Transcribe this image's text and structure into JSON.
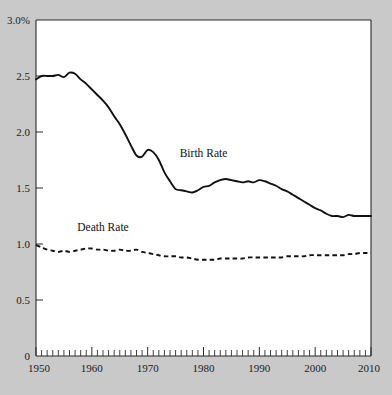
{
  "chart_data": {
    "type": "line",
    "title": "",
    "subtitle": "",
    "xlabel": "",
    "ylabel": "",
    "xlim": [
      1950,
      2010
    ],
    "ylim": [
      0,
      3.0
    ],
    "grid": false,
    "legend_position": "inline-annotations",
    "y_ticks": [
      {
        "value": 3.0,
        "label": "3.0%"
      },
      {
        "value": 2.5,
        "label": "2.5"
      },
      {
        "value": 2.0,
        "label": "2.0"
      },
      {
        "value": 1.5,
        "label": "1.5"
      },
      {
        "value": 1.0,
        "label": "1.0"
      },
      {
        "value": 0.5,
        "label": "0.5"
      },
      {
        "value": 0.0,
        "label": "0"
      }
    ],
    "x_ticks": [
      {
        "value": 1950,
        "label": "1950"
      },
      {
        "value": 1960,
        "label": "1960"
      },
      {
        "value": 1970,
        "label": "1970"
      },
      {
        "value": 1980,
        "label": "1980"
      },
      {
        "value": 1990,
        "label": "1990"
      },
      {
        "value": 2000,
        "label": "2000"
      },
      {
        "value": 2010,
        "label": "2010"
      }
    ],
    "x_minor_tick_interval": 1,
    "annotations": [
      {
        "text": "Birth Rate",
        "x": 1980,
        "y": 1.78
      },
      {
        "text": "Death Rate",
        "x": 1962,
        "y": 1.12
      }
    ],
    "x": [
      1950,
      1951,
      1952,
      1953,
      1954,
      1955,
      1956,
      1957,
      1958,
      1959,
      1960,
      1961,
      1962,
      1963,
      1964,
      1965,
      1966,
      1967,
      1968,
      1969,
      1970,
      1971,
      1972,
      1973,
      1974,
      1975,
      1976,
      1977,
      1978,
      1979,
      1980,
      1981,
      1982,
      1983,
      1984,
      1985,
      1986,
      1987,
      1988,
      1989,
      1990,
      1991,
      1992,
      1993,
      1994,
      1995,
      1996,
      1997,
      1998,
      1999,
      2000,
      2001,
      2002,
      2003,
      2004,
      2005,
      2006,
      2007,
      2008,
      2009,
      2010
    ],
    "series": [
      {
        "name": "Birth Rate",
        "style": "solid",
        "color": "#111111",
        "values": [
          2.47,
          2.5,
          2.5,
          2.5,
          2.51,
          2.49,
          2.53,
          2.52,
          2.47,
          2.43,
          2.38,
          2.33,
          2.28,
          2.22,
          2.14,
          2.07,
          1.98,
          1.88,
          1.79,
          1.78,
          1.84,
          1.82,
          1.75,
          1.64,
          1.56,
          1.49,
          1.48,
          1.47,
          1.46,
          1.48,
          1.51,
          1.52,
          1.55,
          1.57,
          1.58,
          1.57,
          1.56,
          1.55,
          1.56,
          1.55,
          1.57,
          1.56,
          1.54,
          1.52,
          1.49,
          1.47,
          1.44,
          1.41,
          1.38,
          1.35,
          1.32,
          1.3,
          1.27,
          1.25,
          1.25,
          1.24,
          1.26,
          1.25,
          1.25,
          1.25,
          1.25
        ]
      },
      {
        "name": "Death Rate",
        "style": "dashed",
        "color": "#111111",
        "values": [
          0.99,
          0.97,
          0.95,
          0.94,
          0.93,
          0.94,
          0.93,
          0.94,
          0.95,
          0.96,
          0.96,
          0.95,
          0.95,
          0.94,
          0.94,
          0.95,
          0.94,
          0.94,
          0.95,
          0.93,
          0.92,
          0.91,
          0.9,
          0.89,
          0.89,
          0.89,
          0.88,
          0.88,
          0.87,
          0.86,
          0.86,
          0.86,
          0.86,
          0.87,
          0.87,
          0.87,
          0.87,
          0.87,
          0.88,
          0.88,
          0.88,
          0.88,
          0.88,
          0.88,
          0.88,
          0.89,
          0.89,
          0.89,
          0.89,
          0.9,
          0.9,
          0.9,
          0.9,
          0.9,
          0.9,
          0.9,
          0.91,
          0.91,
          0.92,
          0.92,
          0.92
        ]
      }
    ]
  }
}
